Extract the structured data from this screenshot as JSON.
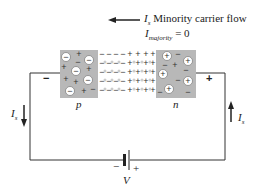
{
  "annotation": {
    "current_symbol": "I",
    "current_subscript": "s",
    "minority_text": "Minority carrier flow",
    "majority_symbol": "I",
    "majority_subscript": "majority",
    "majority_value": "= 0"
  },
  "regions": {
    "p_label": "p",
    "n_label": "n"
  },
  "terminals": {
    "left_sign": "−",
    "right_sign": "+"
  },
  "currents": {
    "left": {
      "symbol": "I",
      "subscript": "s",
      "direction": "down"
    },
    "right": {
      "symbol": "I",
      "subscript": "s",
      "direction": "up"
    }
  },
  "battery": {
    "label": "V",
    "neg_sign": "−",
    "pos_sign": "+"
  },
  "colors": {
    "region_fill": "#b8b8b8",
    "depletion_fill": "#ffffff",
    "line": "#222222"
  }
}
